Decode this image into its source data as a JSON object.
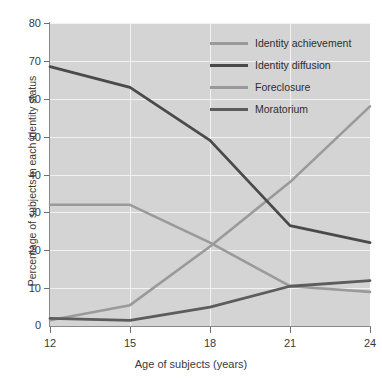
{
  "chart_data": {
    "type": "line",
    "title": "",
    "xlabel": "Age of subjects (years)",
    "ylabel": "Percentage of subjects in each identity status",
    "x": [
      12,
      15,
      18,
      21,
      24
    ],
    "xticks": [
      "12",
      "15",
      "18",
      "21",
      "24"
    ],
    "yticks": [
      "0",
      "10",
      "20",
      "30",
      "40",
      "50",
      "60",
      "70",
      "80"
    ],
    "xlim": [
      12,
      24
    ],
    "ylim": [
      0,
      80
    ],
    "grid": true,
    "legend_position": "top-right",
    "plot_background": "#d4d4d4",
    "series": [
      {
        "name": "Identity achievement",
        "color": "#9a9a9a",
        "values": [
          1.5,
          5.5,
          21,
          38,
          58
        ]
      },
      {
        "name": "Identity diffusion",
        "color": "#4a4a4a",
        "values": [
          68.5,
          63,
          49,
          26.5,
          22
        ]
      },
      {
        "name": "Foreclosure",
        "color": "#9a9a9a",
        "values": [
          32,
          32,
          22,
          10.5,
          9
        ]
      },
      {
        "name": "Moratorium",
        "color": "#5c5c5c",
        "values": [
          2,
          1.5,
          5,
          10.5,
          12
        ]
      }
    ]
  },
  "legend": {
    "items": [
      {
        "label": "Identity achievement",
        "color": "#9a9a9a"
      },
      {
        "label": "Identity diffusion",
        "color": "#4a4a4a"
      },
      {
        "label": "Foreclosure",
        "color": "#9a9a9a"
      },
      {
        "label": "Moratorium",
        "color": "#5c5c5c"
      }
    ]
  }
}
